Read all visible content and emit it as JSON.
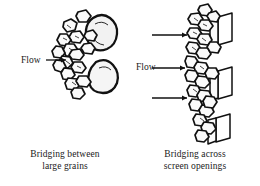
{
  "figure": {
    "background_color": "#ffffff",
    "ink_color": "#111111",
    "width": 260,
    "height": 186
  },
  "panels": [
    {
      "id": "left",
      "caption_line1": "Bridging between",
      "caption_line2": "large grains",
      "flow_labels": [
        {
          "text": "Flow",
          "arrow": "arrow-right-icon"
        }
      ],
      "arrow_count": 1,
      "large_grain_count": 2,
      "small_grain_count": 14,
      "screen_bar_count": 0
    },
    {
      "id": "right",
      "caption_line1": "Bridging across",
      "caption_line2": "screen openings",
      "flow_labels": [
        {
          "text": "Flow",
          "arrow": "arrow-right-icon"
        }
      ],
      "arrow_count": 3,
      "large_grain_count": 0,
      "small_grain_count": 22,
      "screen_bar_count": 3
    }
  ]
}
